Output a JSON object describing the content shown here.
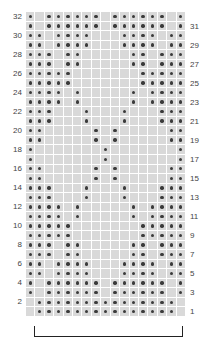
{
  "chart": {
    "columns": 17,
    "rows": 32,
    "colors": {
      "empty": "#d9d9d9",
      "dot": "#3a3a3a",
      "gridline": "#ffffff"
    },
    "left_labels": [
      "32",
      "30",
      "28",
      "26",
      "24",
      "22",
      "20",
      "18",
      "16",
      "14",
      "12",
      "10",
      "8",
      "6",
      "4",
      "2"
    ],
    "right_labels": [
      "31",
      "29",
      "27",
      "25",
      "23",
      "21",
      "19",
      "17",
      "15",
      "13",
      "11",
      "9",
      "7",
      "5",
      "3",
      "1"
    ],
    "dot_rows": {
      "32": [
        1,
        3,
        4,
        5,
        6,
        7,
        8,
        10,
        11,
        12,
        13,
        14,
        15,
        17
      ],
      "31": [
        1,
        3,
        4,
        5,
        6,
        7,
        8,
        10,
        11,
        12,
        13,
        14,
        15,
        17
      ],
      "30": [
        1,
        2,
        4,
        5,
        6,
        7,
        11,
        12,
        13,
        14,
        16,
        17
      ],
      "29": [
        1,
        2,
        4,
        5,
        6,
        7,
        11,
        12,
        13,
        14,
        16,
        17
      ],
      "28": [
        1,
        2,
        3,
        5,
        6,
        12,
        13,
        15,
        16,
        17
      ],
      "27": [
        1,
        2,
        3,
        5,
        6,
        12,
        13,
        15,
        16,
        17
      ],
      "26": [
        1,
        2,
        3,
        4,
        5,
        13,
        14,
        15,
        16,
        17
      ],
      "25": [
        1,
        2,
        3,
        4,
        5,
        13,
        14,
        15,
        16,
        17
      ],
      "24": [
        1,
        2,
        3,
        4,
        6,
        12,
        14,
        15,
        16,
        17
      ],
      "23": [
        1,
        2,
        3,
        4,
        6,
        12,
        14,
        15,
        16,
        17
      ],
      "22": [
        1,
        2,
        3,
        7,
        11,
        15,
        16,
        17
      ],
      "21": [
        1,
        2,
        3,
        7,
        11,
        15,
        16,
        17
      ],
      "20": [
        1,
        2,
        8,
        10,
        16,
        17
      ],
      "19": [
        1,
        2,
        8,
        10,
        16,
        17
      ],
      "18": [
        1,
        9,
        17
      ],
      "17": [
        1,
        9,
        17
      ],
      "16": [
        1,
        2,
        8,
        10,
        16,
        17
      ],
      "15": [
        1,
        2,
        8,
        10,
        16,
        17
      ],
      "14": [
        1,
        2,
        3,
        7,
        11,
        15,
        16,
        17
      ],
      "13": [
        1,
        2,
        3,
        7,
        11,
        15,
        16,
        17
      ],
      "12": [
        1,
        2,
        3,
        4,
        6,
        12,
        14,
        15,
        16,
        17
      ],
      "11": [
        1,
        2,
        3,
        4,
        6,
        12,
        14,
        15,
        16,
        17
      ],
      "10": [
        1,
        2,
        3,
        4,
        5,
        13,
        14,
        15,
        16,
        17
      ],
      "9": [
        1,
        2,
        3,
        4,
        5,
        13,
        14,
        15,
        16,
        17
      ],
      "8": [
        1,
        2,
        3,
        5,
        6,
        12,
        13,
        15,
        16,
        17
      ],
      "7": [
        1,
        2,
        3,
        5,
        6,
        12,
        13,
        15,
        16,
        17
      ],
      "6": [
        1,
        2,
        4,
        5,
        6,
        7,
        11,
        12,
        13,
        14,
        16,
        17
      ],
      "5": [
        1,
        2,
        4,
        5,
        6,
        7,
        11,
        12,
        13,
        14,
        16,
        17
      ],
      "4": [
        1,
        3,
        4,
        5,
        6,
        7,
        8,
        10,
        11,
        12,
        13,
        14,
        15,
        17
      ],
      "3": [
        1,
        3,
        4,
        5,
        6,
        7,
        8,
        10,
        11,
        12,
        13,
        14,
        15,
        17
      ],
      "2": [
        2,
        3,
        4,
        5,
        6,
        7,
        8,
        9,
        10,
        11,
        12,
        13,
        14,
        15,
        16
      ],
      "1": [
        2,
        3,
        4,
        5,
        6,
        7,
        8,
        9,
        10,
        11,
        12,
        13,
        14,
        15,
        16
      ]
    },
    "repeat_bracket": {
      "from_column": 2,
      "to_column": 17
    }
  }
}
